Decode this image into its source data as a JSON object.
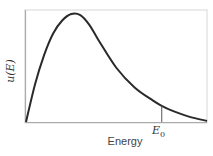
{
  "chart_data": {
    "type": "line",
    "title": "",
    "xlabel": "Energy",
    "ylabel": "u(E)",
    "grid": false,
    "legend": null,
    "series": [
      {
        "name": "u(E)",
        "description": "Energy distribution rising from origin to a peak near ~30% of the x-range, then decaying with a long tail toward zero",
        "x": [
          0,
          0.05,
          0.1,
          0.15,
          0.2,
          0.25,
          0.3,
          0.35,
          0.4,
          0.5,
          0.6,
          0.7,
          0.75,
          0.8,
          0.9,
          1.0
        ],
        "y": [
          0,
          0.35,
          0.62,
          0.82,
          0.94,
          1.0,
          0.99,
          0.9,
          0.76,
          0.5,
          0.32,
          0.2,
          0.15,
          0.11,
          0.05,
          0.01
        ]
      }
    ],
    "annotations": [
      {
        "type": "vline",
        "x": 0.75,
        "label": "E0",
        "from_y": 0,
        "to_y": 0.15
      }
    ],
    "xlim": [
      0,
      1
    ],
    "ylim": [
      0,
      1.05
    ]
  },
  "labels": {
    "x_axis": "Energy",
    "y_axis_main": "u(E)",
    "marker_main": "E",
    "marker_sub": "0"
  }
}
